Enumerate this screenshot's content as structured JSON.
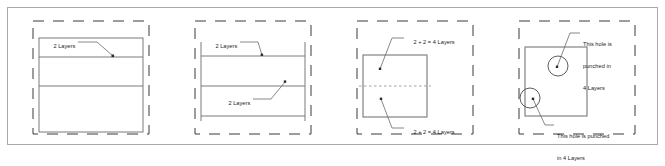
{
  "figure": {
    "colors": {
      "outer_border": "#a9a9a9",
      "dashed_box": "#3a3a3a",
      "solid_rect": "#7a7a7a",
      "inner_line": "#7a7a7a",
      "dashed_inner_line": "#8a8a8a",
      "leader_line": "#6a6a6a",
      "circle": "#4a4a4a",
      "text": "#1a1a1a",
      "background": "#ffffff"
    }
  },
  "panels": [
    {
      "id": "panel-1",
      "name": "two-layers-single-stack",
      "labels": [
        {
          "id": "p1-label-1",
          "text": "2 Layers",
          "lines": [
            "2 Layers"
          ]
        }
      ]
    },
    {
      "id": "panel-2",
      "name": "two-layers-double-stack",
      "labels": [
        {
          "id": "p2-label-1",
          "text": "2 Layers",
          "lines": [
            "2 Layers"
          ]
        },
        {
          "id": "p2-label-2",
          "text": "2 Layers",
          "lines": [
            "2 Layers"
          ]
        }
      ]
    },
    {
      "id": "panel-3",
      "name": "four-layers-folded",
      "labels": [
        {
          "id": "p3-label-1",
          "text": "2 + 2 = 4 Layers",
          "lines": [
            "2 + 2 = 4 Layers"
          ]
        },
        {
          "id": "p3-label-2",
          "text": "2 + 2 = 4 Layers",
          "lines": [
            "2 + 2 = 4 Layers"
          ]
        }
      ]
    },
    {
      "id": "panel-4",
      "name": "punched-holes",
      "labels": [
        {
          "id": "p4-label-1",
          "text": "This hole is punched in 4 Layers",
          "lines": [
            "This hole is",
            "punched in",
            "4 Layers"
          ]
        },
        {
          "id": "p4-label-2",
          "text": "This hole is punched in 4 Layers",
          "lines": [
            "This hole is punched",
            "in 4 Layers"
          ]
        }
      ]
    }
  ],
  "text": {
    "p1_l1_line1": "2 Layers",
    "p2_l1_line1": "2 Layers",
    "p2_l2_line1": "2 Layers",
    "p3_l1_line1": "2 + 2 = 4 Layers",
    "p3_l2_line1": "2 + 2 = 4 Layers",
    "p4_l1_line1": "This hole is",
    "p4_l1_line2": "punched in",
    "p4_l1_line3": "4 Layers",
    "p4_l2_line1": "This hole is punched",
    "p4_l2_line2": "in 4 Layers"
  }
}
